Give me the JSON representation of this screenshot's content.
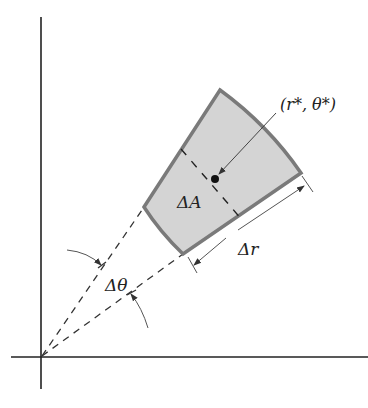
{
  "diagram": {
    "labels": {
      "point": "(r*, θ*)",
      "area": "ΔA",
      "radial_width": "Δr",
      "angle": "Δθ"
    },
    "colors": {
      "region_fill": "#d4d4d4",
      "region_stroke": "#7a7a7a",
      "axis": "#222222",
      "dashed": "#333333",
      "arrow": "#444444"
    }
  }
}
